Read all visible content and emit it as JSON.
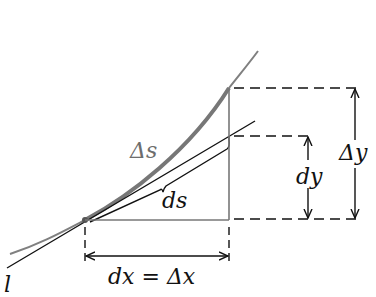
{
  "diagram": {
    "labels": {
      "delta_s": "Δs",
      "ds": "ds",
      "dy": "dy",
      "delta_y": "Δy",
      "dx_eq": "dx = Δx",
      "tangent": "l"
    },
    "colors": {
      "curve": "#777777",
      "ink": "#111111",
      "background": "#ffffff"
    },
    "elements": [
      {
        "id": "curve",
        "description": "curve y=f(x), thick gray arc segment Δs"
      },
      {
        "id": "tangent-line",
        "description": "tangent line l at point"
      },
      {
        "id": "ds-segment",
        "description": "tangent segment ds with brace"
      },
      {
        "id": "dx-dimension",
        "description": "horizontal dimension arrow dx = Δx"
      },
      {
        "id": "dy-dimension",
        "description": "vertical dimension arrow dy"
      },
      {
        "id": "delta-y-dimension",
        "description": "vertical dimension arrow Δy"
      }
    ]
  }
}
